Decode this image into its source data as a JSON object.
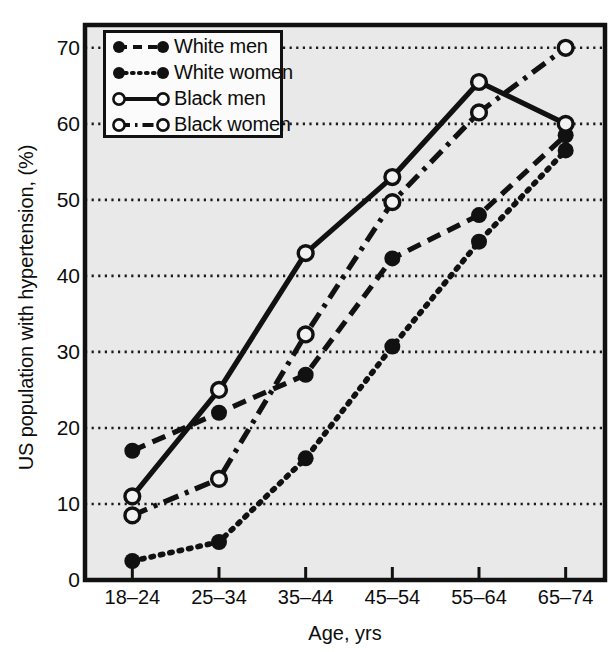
{
  "chart_data": {
    "type": "line",
    "title": "",
    "xlabel": "Age, yrs",
    "ylabel": "US population with hypertension, (%)",
    "categories": [
      "18–24",
      "25–34",
      "35–44",
      "45–54",
      "55–64",
      "65–74"
    ],
    "ylim": [
      0,
      73
    ],
    "yticks": [
      0,
      10,
      20,
      30,
      40,
      50,
      60,
      70
    ],
    "ytick_labels": [
      "0",
      "10",
      "20",
      "30",
      "40",
      "50",
      "60",
      "70"
    ],
    "grid": "horizontal-dotted",
    "legend_position": "top-left",
    "series": [
      {
        "name": "White men",
        "values": [
          17,
          22,
          27,
          42.3,
          48,
          58.5
        ],
        "marker": "filled-circle",
        "line_style": "dashed",
        "color": "#111111"
      },
      {
        "name": "White women",
        "values": [
          2.5,
          5,
          16,
          30.7,
          44.5,
          56.5
        ],
        "marker": "filled-circle",
        "line_style": "dotted",
        "color": "#111111"
      },
      {
        "name": "Black men",
        "values": [
          11,
          25,
          43,
          53,
          65.5,
          60
        ],
        "marker": "open-circle",
        "line_style": "solid",
        "color": "#111111"
      },
      {
        "name": "Black women",
        "values": [
          8.5,
          13.3,
          32.3,
          49.7,
          61.5,
          70
        ],
        "marker": "open-circle",
        "line_style": "dash-dot",
        "color": "#111111"
      }
    ]
  },
  "legend": {
    "entries": [
      {
        "label": "White men"
      },
      {
        "label": "White women"
      },
      {
        "label": "Black men"
      },
      {
        "label": "Black women"
      }
    ]
  },
  "axes": {
    "plot_background": "#e9e9e9",
    "frame_color": "#111111",
    "gridline_color": "#1a1a1a"
  }
}
